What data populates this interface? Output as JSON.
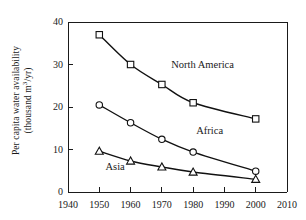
{
  "chart_data": {
    "type": "line",
    "title": "",
    "xlabel": "",
    "ylabel": "Per capita water availability (thousand m3/yr)",
    "ylabel_line1": "Per capita water availability",
    "ylabel_line2_pre": "(thousand m",
    "ylabel_line2_exp": "3",
    "ylabel_line2_post": "/yr)",
    "x": [
      1950,
      1960,
      1970,
      1980,
      2000
    ],
    "xlim": [
      1940,
      2010
    ],
    "ylim": [
      0,
      40
    ],
    "xticks": [
      1940,
      1950,
      1960,
      1970,
      1980,
      1990,
      2000,
      2010
    ],
    "xtick_labels": [
      "1940",
      "1950",
      "1960",
      "1970",
      "1980",
      "1990",
      "2000",
      "2010"
    ],
    "yticks": [
      0,
      10,
      20,
      30,
      40
    ],
    "ytick_labels": [
      "0",
      "10",
      "20",
      "30",
      "40"
    ],
    "grid": false,
    "legend_position": "inline-annotations",
    "series": [
      {
        "name": "North America",
        "marker": "square",
        "values": [
          37.0,
          30.0,
          25.3,
          21.0,
          17.2
        ],
        "annotation": "North America"
      },
      {
        "name": "Africa",
        "marker": "circle",
        "values": [
          20.5,
          16.3,
          12.4,
          9.4,
          4.9
        ],
        "annotation": "Africa"
      },
      {
        "name": "Asia",
        "marker": "triangle",
        "values": [
          9.6,
          7.3,
          5.9,
          4.7,
          3.0
        ],
        "annotation": "Asia"
      }
    ],
    "annotations": [
      {
        "text": "North America",
        "x": 1973,
        "y": 29.2
      },
      {
        "text": "Africa",
        "x": 1981,
        "y": 13.6
      },
      {
        "text": "Asia",
        "x": 1952,
        "y": 5.2
      }
    ],
    "colors": {
      "line": "#111111",
      "marker_fill": "#ffffff",
      "axis": "#1a1a1a",
      "background": "#ffffff"
    }
  }
}
